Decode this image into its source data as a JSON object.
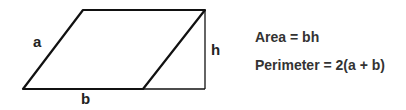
{
  "diagram": {
    "labels": {
      "side": "a",
      "base": "b",
      "height": "h"
    },
    "formulas": {
      "area": "Area = bh",
      "perimeter": "Perimeter = 2(a + b)"
    },
    "colors": {
      "stroke": "#111111",
      "text": "#333333"
    }
  }
}
